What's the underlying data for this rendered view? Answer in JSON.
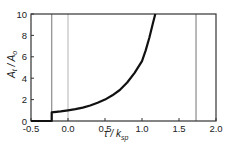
{
  "chart_data": {
    "type": "line",
    "title": "",
    "xlabel": "τ / k_sp",
    "ylabel": "A_t / A_0",
    "xlim": [
      -0.5,
      2.0
    ],
    "ylim": [
      0,
      10
    ],
    "xticks": [
      "-0.5",
      "0.0",
      "0.5",
      "1.0",
      "1.5",
      "2.0"
    ],
    "yticks": [
      "0",
      "2",
      "4",
      "6",
      "8",
      "10"
    ],
    "grid": false,
    "legend": null,
    "series": [
      {
        "name": "A_t/A_0",
        "color": "#111111",
        "x": [
          -0.5,
          -0.22,
          -0.22,
          -0.1,
          0.0,
          0.1,
          0.2,
          0.3,
          0.4,
          0.5,
          0.6,
          0.7,
          0.8,
          0.9,
          1.0,
          1.05,
          1.1,
          1.15,
          1.18
        ],
        "y": [
          0,
          0,
          0.8,
          0.9,
          1.0,
          1.1,
          1.25,
          1.45,
          1.7,
          2.0,
          2.4,
          2.9,
          3.6,
          4.5,
          5.6,
          6.6,
          7.8,
          9.2,
          10
        ]
      }
    ],
    "vertical_lines": [
      {
        "x": -0.22,
        "color": "#8a8a8a"
      },
      {
        "x": 0.0,
        "color": "#c0c0c0"
      },
      {
        "x": 1.73,
        "color": "#8a8a8a"
      }
    ]
  },
  "labels": {
    "ylabel_main": "A",
    "ylabel_sub1": "t",
    "ylabel_sep": " / A",
    "ylabel_sub2": "o",
    "xlabel_main": "τ / k",
    "xlabel_sub": "sp"
  }
}
